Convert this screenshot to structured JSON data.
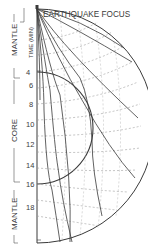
{
  "title": "EARTHQUAKE FOCUS",
  "axis_label": "TIME (MIN)",
  "layers": [
    {
      "name": "MANTLE",
      "position": "upper"
    },
    {
      "name": "CORE",
      "position": "middle"
    },
    {
      "name": "MANTLE",
      "position": "lower"
    }
  ],
  "time_ticks": [
    "4",
    "6",
    "8",
    "10",
    "12",
    "14",
    "16",
    "18"
  ],
  "colors": {
    "line": "#3a3a3a",
    "dashed": "#9a9a9a",
    "background": "#ffffff"
  }
}
